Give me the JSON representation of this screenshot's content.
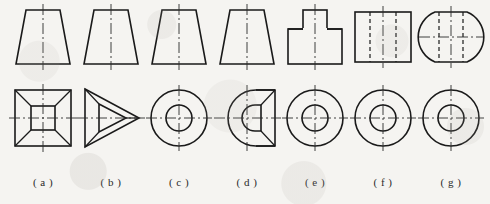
{
  "page": {
    "background_color": "#f5f4f1",
    "line_color": "#1a1a1a",
    "center_line_color": "#2b2b2b",
    "width": 490,
    "height": 204,
    "rows": [
      "top-view-row",
      "front-view-row"
    ],
    "caption_row": "figure-labels"
  },
  "columns": [
    {
      "id": "a",
      "label": "( a )",
      "x": 8,
      "top_view": {
        "name": "trapezoid",
        "description": "isosceles trapezoid, narrow top, wide bottom, vertical center line"
      },
      "front_view": {
        "name": "square-with-inner-square",
        "description": "outer square, concentric inner square, four corner diagonals, horizontal and vertical center lines"
      },
      "solid": "truncated square pyramid"
    },
    {
      "id": "b",
      "label": "( b )",
      "x": 76,
      "top_view": {
        "name": "trapezoid",
        "description": "isosceles trapezoid, narrow top, wide bottom, vertical center line"
      },
      "front_view": {
        "name": "triangle-with-inner-triangle",
        "description": "outer triangle pointing right, inner triangle, three vertex connector lines, horizontal center line"
      },
      "solid": "truncated triangular pyramid"
    },
    {
      "id": "c",
      "label": "( c )",
      "x": 144,
      "top_view": {
        "name": "trapezoid",
        "description": "isosceles trapezoid, narrow top, wide bottom, vertical center line"
      },
      "front_view": {
        "name": "concentric-circles",
        "description": "large outer circle with smaller concentric circle, cross center lines"
      },
      "solid": "truncated cone"
    },
    {
      "id": "d",
      "label": "( d )",
      "x": 212,
      "top_view": {
        "name": "trapezoid",
        "description": "isosceles trapezoid, narrow top, wide bottom, vertical center line"
      },
      "front_view": {
        "name": "d-shape-with-inner-d",
        "description": "outer D shape, round on left and square on right, inner D shape with corner diagonals, cross center lines"
      },
      "solid": "truncated cone with flat face"
    },
    {
      "id": "e",
      "label": "( e )",
      "x": 280,
      "top_view": {
        "name": "stepped-rectangles",
        "description": "small rectangle stacked on a wider rectangle, vertical center line"
      },
      "front_view": {
        "name": "concentric-circles",
        "description": "large outer circle with smaller concentric circle, cross center lines"
      },
      "solid": "stepped cylinder"
    },
    {
      "id": "f",
      "label": "( f )",
      "x": 348,
      "top_view": {
        "name": "rectangle-with-hidden-lines",
        "description": "rectangle with two vertical dashed hidden lines, vertical center line"
      },
      "front_view": {
        "name": "concentric-circles",
        "description": "large outer circle with smaller concentric circle, cross center lines"
      },
      "solid": "cylinder with bore"
    },
    {
      "id": "g",
      "label": "( g )",
      "x": 416,
      "top_view": {
        "name": "stadium-with-hidden-lines",
        "description": "barrel shape with flat top and bottom and curved sides, two vertical dashed hidden lines, horizontal and vertical center lines"
      },
      "front_view": {
        "name": "concentric-circles",
        "description": "large outer circle with smaller concentric circle, cross center lines"
      },
      "solid": "sphere flattened top and bottom with bore"
    }
  ]
}
